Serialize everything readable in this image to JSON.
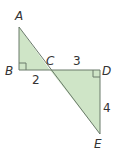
{
  "diagram": {
    "type": "geometry",
    "points": {
      "A": {
        "label": "A",
        "x": 19,
        "y": 27
      },
      "B": {
        "label": "B",
        "x": 19,
        "y": 70
      },
      "C": {
        "label": "C",
        "x": 50,
        "y": 70
      },
      "D": {
        "label": "D",
        "x": 100,
        "y": 70
      },
      "E": {
        "label": "E",
        "x": 100,
        "y": 134
      }
    },
    "segment_labels": {
      "BC": "2",
      "CD": "3",
      "DE": "4"
    },
    "right_angles": [
      "B",
      "D"
    ],
    "colors": {
      "fill": "#cfe5c7",
      "stroke": "#6a7a6a"
    }
  }
}
